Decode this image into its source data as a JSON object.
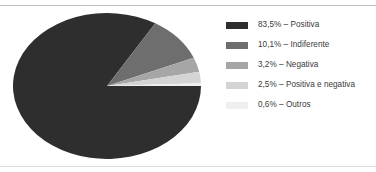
{
  "figure": {
    "background": "#ffffff",
    "rule_color": "#c9c9c9"
  },
  "chart_data": {
    "type": "pie",
    "title": "",
    "subtitle": "",
    "xlabel": "",
    "ylabel": "",
    "grid": false,
    "legend_position": "right",
    "value_unit": "%",
    "decimal_separator": ",",
    "start_angle_deg": 0,
    "direction": "clockwise",
    "shape": "ellipse",
    "categories": [
      "Positiva",
      "Indiferente",
      "Negativa",
      "Positiva e negativa",
      "Outros"
    ],
    "values": [
      83.5,
      10.1,
      3.2,
      2.5,
      0.6
    ],
    "value_labels": [
      "83,5%",
      "10,1%",
      "3,2%",
      "2,5%",
      "0,6%"
    ],
    "colors": [
      "#2e2e2e",
      "#6e6e6e",
      "#a6a6a6",
      "#d4d4d4",
      "#efefef"
    ],
    "slices": [
      {
        "label": "Positiva",
        "value": 83.5,
        "value_label": "83,5%",
        "color": "#2e2e2e"
      },
      {
        "label": "Indiferente",
        "value": 10.1,
        "value_label": "10,1%",
        "color": "#6e6e6e"
      },
      {
        "label": "Negativa",
        "value": 3.2,
        "value_label": "3,2%",
        "color": "#a6a6a6"
      },
      {
        "label": "Positiva e negativa",
        "value": 2.5,
        "value_label": "2,5%",
        "color": "#d4d4d4"
      },
      {
        "label": "Outros",
        "value": 0.6,
        "value_label": "0,6%",
        "color": "#efefef"
      }
    ]
  },
  "legend": {
    "entries": [
      {
        "text": "83,5% – Positiva",
        "color": "#2e2e2e"
      },
      {
        "text": "10,1% – Indiferente",
        "color": "#6e6e6e"
      },
      {
        "text": "3,2% – Negativa",
        "color": "#a6a6a6"
      },
      {
        "text": "2,5% – Positiva e negativa",
        "color": "#d4d4d4"
      },
      {
        "text": "0,6% – Outros",
        "color": "#efefef"
      }
    ]
  }
}
